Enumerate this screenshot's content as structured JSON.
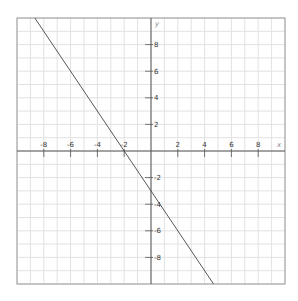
{
  "chart_data": {
    "type": "line",
    "title": "",
    "xlabel": "x",
    "ylabel": "y",
    "xlim": [
      -10,
      10
    ],
    "ylim": [
      -10,
      10
    ],
    "grid": true,
    "x_ticks": [
      -8,
      -6,
      -4,
      -2,
      2,
      4,
      6,
      8
    ],
    "y_ticks": [
      -8,
      -6,
      -4,
      -2,
      2,
      4,
      6,
      8
    ],
    "x_tick_labels": [
      "-8",
      "-6",
      "-4",
      "-2",
      "2",
      "4",
      "6",
      "8"
    ],
    "y_tick_labels": [
      "-8",
      "-6",
      "-4",
      "-2",
      "2",
      "4",
      "6",
      "8"
    ],
    "series": [
      {
        "name": "y = -1.5x - 3",
        "slope": -1.5,
        "intercept": -3,
        "x": [
          -8.67,
          4.67
        ],
        "y": [
          10,
          -10
        ]
      }
    ],
    "legend": null
  },
  "colors": {
    "grid": "#e2e2e2",
    "axis": "#555555",
    "frame": "#999999",
    "line": "#444444"
  }
}
